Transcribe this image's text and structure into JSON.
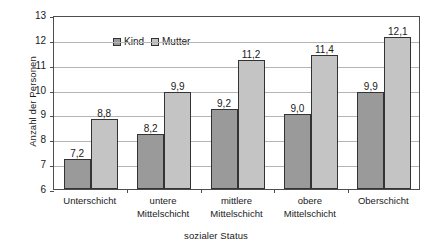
{
  "chart_data": {
    "type": "bar",
    "title": "",
    "xlabel": "sozialer Status",
    "ylabel": "Anzahl der Personen",
    "ylim": [
      6,
      13
    ],
    "yticks": [
      "6",
      "7",
      "8",
      "9",
      "10",
      "11",
      "12",
      "13"
    ],
    "grid": true,
    "legend_position": "top-left-inside",
    "categories": [
      "Unterschicht",
      "untere Mittelschicht",
      "mittlere Mittelschicht",
      "obere Mittelschicht",
      "Oberschicht"
    ],
    "category_lines": [
      [
        "Unterschicht"
      ],
      [
        "untere",
        "Mittelschicht"
      ],
      [
        "mittlere",
        "Mittelschicht"
      ],
      [
        "obere",
        "Mittelschicht"
      ],
      [
        "Oberschicht"
      ]
    ],
    "series": [
      {
        "name": "Kind",
        "color": "#9a9a9a",
        "values": [
          7.2,
          8.2,
          9.2,
          9.0,
          9.9
        ],
        "labels": [
          "7,2",
          "8,2",
          "9,2",
          "9,0",
          "9,9"
        ]
      },
      {
        "name": "Mutter",
        "color": "#c4c4c4",
        "values": [
          8.8,
          9.9,
          11.2,
          11.4,
          12.1
        ],
        "labels": [
          "8,8",
          "9,9",
          "11,2",
          "11,4",
          "12,1"
        ]
      }
    ]
  },
  "legend": {
    "entries": [
      {
        "label": "Kind"
      },
      {
        "label": "Mutter"
      }
    ]
  },
  "colors": {
    "kind": "#9a9a9a",
    "mutter": "#c4c4c4",
    "axis": "#4d4d4d",
    "gridline": "#b5b5b5",
    "bar_border": "#333333",
    "background": "#ffffff"
  }
}
